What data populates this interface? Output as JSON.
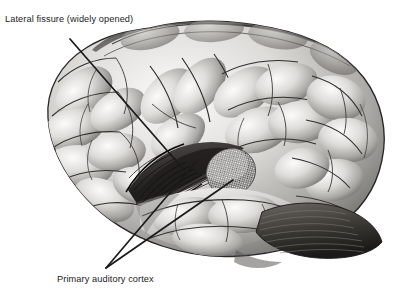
{
  "figure": {
    "background_color": "#ffffff",
    "ink_color": "#1a1a1a",
    "medium": "grayscale anatomical drawing",
    "view": "left lateral"
  },
  "labels": {
    "lateral_fissure": {
      "text": "Lateral fissure (widely opened)",
      "x": 5,
      "y": 22
    },
    "primary_auditory_cortex": {
      "text": "Primary auditory cortex",
      "x": 57,
      "y": 282
    }
  },
  "leader_lines": [
    {
      "name": "lateral-fissure-leader",
      "from_x": 70,
      "from_y": 39,
      "to_x": 184,
      "to_y": 170,
      "width": 1.7
    },
    {
      "name": "auditory-cortex-leader-upper",
      "from_x": 106,
      "from_y": 268,
      "to_x": 233,
      "to_y": 180,
      "width": 1.7
    },
    {
      "name": "auditory-cortex-leader-lower",
      "from_x": 106,
      "from_y": 268,
      "to_x": 196,
      "to_y": 162,
      "width": 1.7
    }
  ],
  "regions": {
    "auditory_patch": {
      "name": "primary auditory cortex",
      "shading": "stipple / cross-hatch",
      "center_x": 231,
      "center_y": 172,
      "radius_x": 25,
      "radius_y": 23,
      "rotation_deg": -28
    },
    "lateral_fissure": {
      "name": "lateral fissure (opened)",
      "shading": "dark striated depth",
      "center_x": 170,
      "center_y": 178
    },
    "cerebellum": {
      "name": "cerebellum",
      "shading": "dark horizontal folia",
      "center_x": 300,
      "center_y": 233
    }
  },
  "colors": {
    "paper": "#ffffff",
    "ink": "#1a1a1a",
    "cortex_light": "#f0efee",
    "cortex_mid": "#b9b7b4",
    "cortex_dark": "#5e5c5a",
    "fissure_dark": "#2a2826",
    "stipple": "#6e6c6a"
  }
}
